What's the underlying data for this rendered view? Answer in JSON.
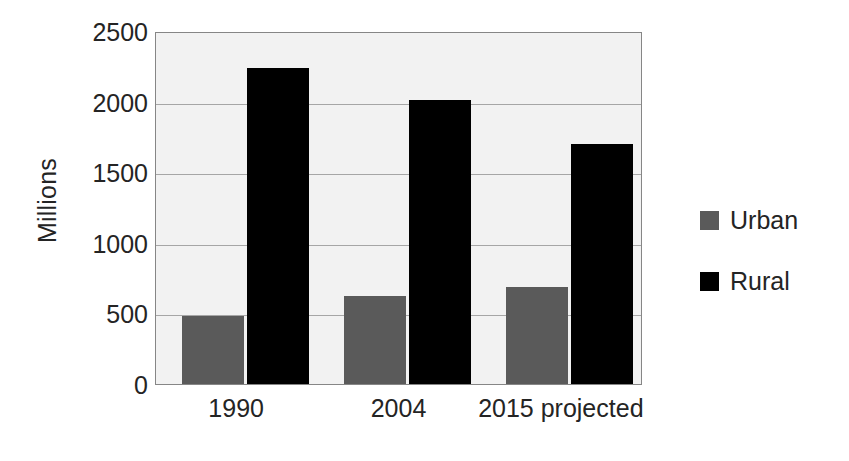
{
  "chart_data": {
    "type": "bar",
    "title": "",
    "xlabel": "",
    "ylabel": "Millions",
    "categories": [
      "1990",
      "2004",
      "2015 projected"
    ],
    "series": [
      {
        "name": "Urban",
        "color": "#5a5a5a",
        "values": [
          480,
          620,
          690
        ]
      },
      {
        "name": "Rural",
        "color": "#000000",
        "values": [
          2240,
          2010,
          1700
        ]
      }
    ],
    "ylim": [
      0,
      2500
    ],
    "yticks": [
      0,
      500,
      1000,
      1500,
      2000,
      2500
    ],
    "ytick_labels": [
      "0",
      "500",
      "1000",
      "1500",
      "2000",
      "2500"
    ],
    "grid": true,
    "grid_axis": "y",
    "legend_position": "right",
    "plot_background": "#f2f2f2",
    "plot_border": "#868686",
    "gridline_color": "#a6a6a6"
  },
  "legend": {
    "items": [
      {
        "label": "Urban",
        "swatch": "#5a5a5a"
      },
      {
        "label": "Rural",
        "swatch": "#000000"
      }
    ]
  }
}
